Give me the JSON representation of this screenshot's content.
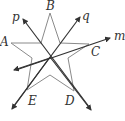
{
  "diagram": {
    "title": "",
    "colors": {
      "star": "#8a8a8a",
      "line": "#333333",
      "label": "#333333"
    },
    "points": {
      "A": {
        "label": "A"
      },
      "B": {
        "label": "B"
      },
      "C": {
        "label": "C"
      },
      "D": {
        "label": "D"
      },
      "E": {
        "label": "E"
      }
    },
    "lines": {
      "p": {
        "label": "p"
      },
      "q": {
        "label": "q"
      },
      "m": {
        "label": "m"
      }
    }
  }
}
